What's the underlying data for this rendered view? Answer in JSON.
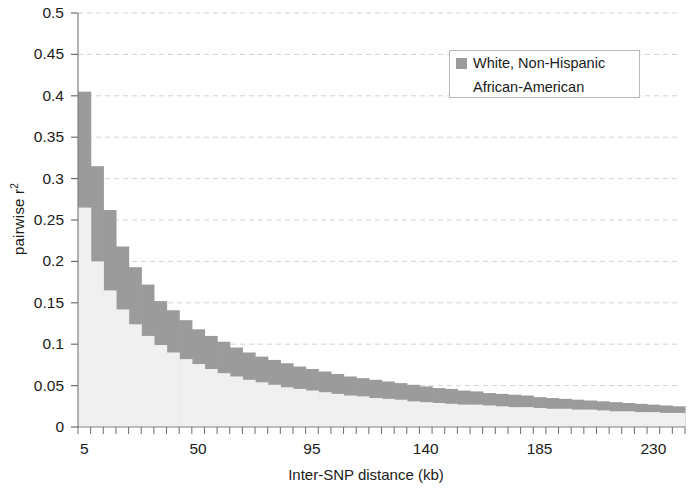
{
  "chart_data": {
    "type": "bar",
    "title": "",
    "subtitle": "",
    "xlabel": "Inter-SNP distance (kb)",
    "ylabel": "pairwise r",
    "ylabel_sup": "2",
    "xlim": [
      5,
      245
    ],
    "ylim": [
      0,
      0.5
    ],
    "grid": true,
    "grid_axis": "y",
    "grid_style": "dashed",
    "legend_position": "top-right",
    "bar_overlap": "overlaid",
    "bin_width_kb": 5,
    "ytick_labels": [
      "0.5",
      "0.45",
      "0.4",
      "0.35",
      "0.3",
      "0.25",
      "0.2",
      "0.15",
      "0.1",
      "0.05",
      "0"
    ],
    "ytick_values": [
      0.5,
      0.45,
      0.4,
      0.35,
      0.3,
      0.25,
      0.2,
      0.15,
      0.1,
      0.05,
      0
    ],
    "xtick_labels": [
      "5",
      "50",
      "95",
      "140",
      "185",
      "230"
    ],
    "xtick_values": [
      5,
      50,
      95,
      140,
      185,
      230
    ],
    "x": [
      5,
      10,
      15,
      20,
      25,
      30,
      35,
      40,
      45,
      50,
      55,
      60,
      65,
      70,
      75,
      80,
      85,
      90,
      95,
      100,
      105,
      110,
      115,
      120,
      125,
      130,
      135,
      140,
      145,
      150,
      155,
      160,
      165,
      170,
      175,
      180,
      185,
      190,
      195,
      200,
      205,
      210,
      215,
      220,
      225,
      230,
      235,
      240
    ],
    "series": [
      {
        "name": "White, Non-Hispanic",
        "color": "#9b9b9b",
        "values": [
          0.405,
          0.315,
          0.262,
          0.218,
          0.193,
          0.172,
          0.152,
          0.141,
          0.129,
          0.118,
          0.11,
          0.103,
          0.096,
          0.09,
          0.085,
          0.081,
          0.077,
          0.073,
          0.07,
          0.067,
          0.064,
          0.061,
          0.059,
          0.057,
          0.055,
          0.053,
          0.051,
          0.049,
          0.047,
          0.046,
          0.044,
          0.043,
          0.041,
          0.04,
          0.039,
          0.038,
          0.036,
          0.035,
          0.034,
          0.033,
          0.032,
          0.031,
          0.03,
          0.029,
          0.028,
          0.027,
          0.026,
          0.025
        ]
      },
      {
        "name": "African-American",
        "color": "#f0f0f0",
        "values": [
          0.265,
          0.2,
          0.165,
          0.142,
          0.124,
          0.11,
          0.099,
          0.09,
          0.082,
          0.076,
          0.07,
          0.065,
          0.061,
          0.057,
          0.054,
          0.051,
          0.048,
          0.046,
          0.044,
          0.042,
          0.04,
          0.038,
          0.037,
          0.035,
          0.034,
          0.033,
          0.031,
          0.03,
          0.029,
          0.028,
          0.027,
          0.027,
          0.026,
          0.025,
          0.024,
          0.024,
          0.023,
          0.022,
          0.022,
          0.021,
          0.021,
          0.02,
          0.019,
          0.019,
          0.018,
          0.018,
          0.017,
          0.017
        ]
      }
    ]
  },
  "legend": {
    "entries": [
      {
        "label": "White, Non-Hispanic",
        "color": "#9b9b9b"
      },
      {
        "label": "African-American",
        "color": "#f0f0f0"
      }
    ]
  },
  "axes": {
    "x_axis_title": "Inter-SNP distance (kb)",
    "y_axis_title": "pairwise r"
  }
}
